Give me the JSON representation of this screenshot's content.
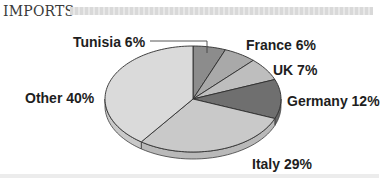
{
  "header": {
    "title": "IMPORTS"
  },
  "chart_data": {
    "type": "pie",
    "title": "IMPORTS",
    "style": "3d-pie",
    "categories": [
      "Tunisia",
      "France",
      "UK",
      "Germany",
      "Italy",
      "Other"
    ],
    "values": [
      6,
      6,
      7,
      12,
      29,
      40
    ],
    "unit": "%",
    "labels": [
      "Tunisia 6%",
      "France 6%",
      "UK 7%",
      "Germany 12%",
      "Italy 29%",
      "Other 40%"
    ],
    "colors": [
      "#8c8c8c",
      "#a9a9a9",
      "#bebebe",
      "#6f6f6f",
      "#c9c9c9",
      "#dadada"
    ],
    "start_angle": "12 o'clock",
    "direction": "clockwise",
    "legend": "none (direct labels)"
  }
}
